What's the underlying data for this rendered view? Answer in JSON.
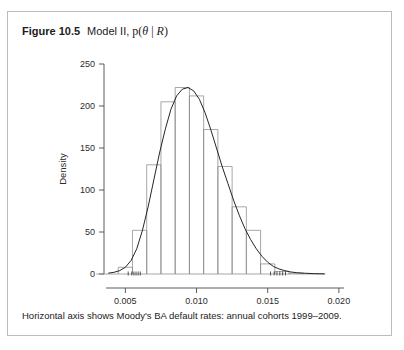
{
  "figure": {
    "number_label": "Figure 10.5",
    "title_text": "Model II,",
    "title_math_prefix": "p(",
    "title_math_theta": "θ",
    "title_math_bar": " | ",
    "title_math_R": "R",
    "title_math_suffix": ")",
    "caption": "Horizontal axis shows Moody's BA default rates: annual cohorts 1999–2009."
  },
  "chart_data": {
    "type": "bar",
    "title": "",
    "subtitle": "",
    "xlabel": "θ",
    "ylabel": "Density",
    "xlim": [
      0.0035,
      0.0205
    ],
    "ylim": [
      0,
      250
    ],
    "grid": false,
    "legend": null,
    "xticks": [
      0.005,
      0.01,
      0.015,
      0.02
    ],
    "xtick_labels": [
      "0.005",
      "0.010",
      "0.015",
      "0.020"
    ],
    "yticks": [
      0,
      50,
      100,
      150,
      200,
      250
    ],
    "ytick_labels": [
      "0",
      "50",
      "100",
      "150",
      "200",
      "250"
    ],
    "bin_width": 0.001,
    "bin_edges": [
      0.0045,
      0.0055,
      0.0065,
      0.0075,
      0.0085,
      0.0095,
      0.0105,
      0.0115,
      0.0125,
      0.0135,
      0.0145,
      0.0155,
      0.0165,
      0.0175
    ],
    "categories": [
      "0.0045-0.0055",
      "0.0055-0.0065",
      "0.0065-0.0075",
      "0.0075-0.0085",
      "0.0085-0.0095",
      "0.0095-0.0105",
      "0.0105-0.0115",
      "0.0115-0.0125",
      "0.0125-0.0135",
      "0.0135-0.0145",
      "0.0145-0.0155",
      "0.0155-0.0165",
      "0.0165-0.0175"
    ],
    "values": [
      8,
      52,
      130,
      205,
      222,
      212,
      172,
      128,
      80,
      52,
      12,
      3,
      1
    ],
    "overlay": {
      "type": "line",
      "name": "kernel density estimate",
      "x": [
        0.0038,
        0.0042,
        0.0046,
        0.005,
        0.0054,
        0.0058,
        0.0062,
        0.0066,
        0.007,
        0.0074,
        0.0078,
        0.0082,
        0.0086,
        0.009,
        0.0094,
        0.0098,
        0.0102,
        0.0106,
        0.011,
        0.0114,
        0.0118,
        0.0122,
        0.0126,
        0.013,
        0.0134,
        0.0138,
        0.0142,
        0.0146,
        0.015,
        0.0154,
        0.0158,
        0.0162,
        0.0166,
        0.017,
        0.0176,
        0.0183,
        0.019
      ],
      "y": [
        1,
        2,
        4,
        8,
        16,
        30,
        52,
        80,
        112,
        144,
        172,
        196,
        212,
        220,
        222,
        218,
        208,
        192,
        172,
        150,
        128,
        108,
        88,
        70,
        54,
        41,
        30,
        21,
        14,
        9,
        6,
        4,
        2.5,
        1.6,
        0.9,
        0.4,
        0.2
      ]
    },
    "rug_marks": [
      0.0052,
      0.00545,
      0.0056,
      0.00575,
      0.0059,
      0.00605,
      0.0152,
      0.01545,
      0.01565,
      0.01585,
      0.01605,
      0.01625
    ]
  }
}
